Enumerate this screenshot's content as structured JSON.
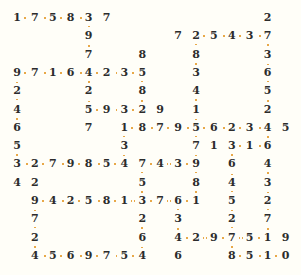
{
  "puzzle": {
    "type": "number-chain-grid",
    "cols": 16,
    "rows": 14,
    "origin": {
      "x": 17,
      "y": 18
    },
    "pitch": {
      "x": 17.9,
      "y": 18.3
    },
    "colors": {
      "digit": "#2c2c2c",
      "connector": "#e8a848",
      "background": "#fffef8"
    },
    "cells": [
      [
        0,
        0,
        "1"
      ],
      [
        0,
        1,
        "7"
      ],
      [
        0,
        2,
        "5"
      ],
      [
        0,
        3,
        "8"
      ],
      [
        0,
        4,
        "3"
      ],
      [
        0,
        5,
        "7"
      ],
      [
        0,
        14,
        "2"
      ],
      [
        1,
        4,
        "9"
      ],
      [
        1,
        9,
        "7"
      ],
      [
        1,
        10,
        "2"
      ],
      [
        1,
        11,
        "5"
      ],
      [
        1,
        12,
        "4"
      ],
      [
        1,
        13,
        "3"
      ],
      [
        1,
        14,
        "7"
      ],
      [
        2,
        4,
        "7"
      ],
      [
        2,
        7,
        "8"
      ],
      [
        2,
        10,
        "8"
      ],
      [
        2,
        14,
        "3"
      ],
      [
        3,
        0,
        "9"
      ],
      [
        3,
        1,
        "7"
      ],
      [
        3,
        2,
        "1"
      ],
      [
        3,
        3,
        "6"
      ],
      [
        3,
        4,
        "4"
      ],
      [
        3,
        5,
        "2"
      ],
      [
        3,
        6,
        "3"
      ],
      [
        3,
        7,
        "5"
      ],
      [
        3,
        10,
        "3"
      ],
      [
        3,
        14,
        "6"
      ],
      [
        4,
        0,
        "2"
      ],
      [
        4,
        4,
        "2"
      ],
      [
        4,
        7,
        "8"
      ],
      [
        4,
        10,
        "4"
      ],
      [
        4,
        14,
        "5"
      ],
      [
        5,
        0,
        "4"
      ],
      [
        5,
        4,
        "5"
      ],
      [
        5,
        5,
        "9"
      ],
      [
        5,
        6,
        "3"
      ],
      [
        5,
        7,
        "2"
      ],
      [
        5,
        8,
        "9"
      ],
      [
        5,
        10,
        "1"
      ],
      [
        5,
        14,
        "2"
      ],
      [
        6,
        0,
        "6"
      ],
      [
        6,
        4,
        "7"
      ],
      [
        6,
        6,
        "1"
      ],
      [
        6,
        7,
        "8"
      ],
      [
        6,
        8,
        "7"
      ],
      [
        6,
        9,
        "9"
      ],
      [
        6,
        10,
        "5"
      ],
      [
        6,
        11,
        "6"
      ],
      [
        6,
        12,
        "2"
      ],
      [
        6,
        13,
        "3"
      ],
      [
        6,
        14,
        "4"
      ],
      [
        6,
        15,
        "5"
      ],
      [
        7,
        0,
        "5"
      ],
      [
        7,
        6,
        "3"
      ],
      [
        7,
        10,
        "7"
      ],
      [
        7,
        11,
        "1"
      ],
      [
        7,
        12,
        "3"
      ],
      [
        7,
        13,
        "1"
      ],
      [
        7,
        14,
        "6"
      ],
      [
        8,
        0,
        "3"
      ],
      [
        8,
        1,
        "2"
      ],
      [
        8,
        2,
        "7"
      ],
      [
        8,
        3,
        "9"
      ],
      [
        8,
        4,
        "8"
      ],
      [
        8,
        5,
        "5"
      ],
      [
        8,
        6,
        "4"
      ],
      [
        8,
        7,
        "7"
      ],
      [
        8,
        8,
        "4"
      ],
      [
        8,
        9,
        "3"
      ],
      [
        8,
        10,
        "9"
      ],
      [
        8,
        12,
        "6"
      ],
      [
        8,
        14,
        "4"
      ],
      [
        9,
        0,
        "4"
      ],
      [
        9,
        1,
        "2"
      ],
      [
        9,
        7,
        "5"
      ],
      [
        9,
        10,
        "8"
      ],
      [
        9,
        12,
        "4"
      ],
      [
        9,
        14,
        "3"
      ],
      [
        10,
        1,
        "9"
      ],
      [
        10,
        2,
        "4"
      ],
      [
        10,
        3,
        "2"
      ],
      [
        10,
        4,
        "5"
      ],
      [
        10,
        5,
        "8"
      ],
      [
        10,
        6,
        "1"
      ],
      [
        10,
        7,
        "3"
      ],
      [
        10,
        8,
        "7"
      ],
      [
        10,
        9,
        "6"
      ],
      [
        10,
        10,
        "1"
      ],
      [
        10,
        12,
        "5"
      ],
      [
        10,
        14,
        "2"
      ],
      [
        11,
        1,
        "7"
      ],
      [
        11,
        7,
        "2"
      ],
      [
        11,
        9,
        "3"
      ],
      [
        11,
        12,
        "2"
      ],
      [
        11,
        14,
        "7"
      ],
      [
        12,
        1,
        "2"
      ],
      [
        12,
        7,
        "6"
      ],
      [
        12,
        9,
        "4"
      ],
      [
        12,
        10,
        "2"
      ],
      [
        12,
        11,
        "9"
      ],
      [
        12,
        12,
        "7"
      ],
      [
        12,
        13,
        "5"
      ],
      [
        12,
        14,
        "1"
      ],
      [
        12,
        15,
        "9"
      ],
      [
        13,
        1,
        "4"
      ],
      [
        13,
        2,
        "5"
      ],
      [
        13,
        3,
        "6"
      ],
      [
        13,
        4,
        "9"
      ],
      [
        13,
        5,
        "7"
      ],
      [
        13,
        6,
        "5"
      ],
      [
        13,
        7,
        "4"
      ],
      [
        13,
        9,
        "6"
      ],
      [
        13,
        12,
        "8"
      ],
      [
        13,
        13,
        "5"
      ],
      [
        13,
        14,
        "1"
      ],
      [
        13,
        15,
        "0"
      ]
    ],
    "h_links": [
      [
        0,
        0,
        4
      ],
      [
        1,
        10,
        14
      ],
      [
        3,
        0,
        7
      ],
      [
        5,
        4,
        7
      ],
      [
        6,
        6,
        14
      ],
      [
        7,
        12,
        14
      ],
      [
        8,
        0,
        6
      ],
      [
        8,
        7,
        10
      ],
      [
        10,
        1,
        10
      ],
      [
        12,
        9,
        14
      ],
      [
        13,
        1,
        7
      ],
      [
        13,
        12,
        15
      ]
    ],
    "v_links": [
      [
        0,
        3,
        8
      ],
      [
        4,
        0,
        5
      ],
      [
        7,
        3,
        5
      ],
      [
        10,
        1,
        10
      ],
      [
        14,
        1,
        12
      ],
      [
        6,
        6,
        8
      ],
      [
        7,
        8,
        13
      ],
      [
        1,
        10,
        13
      ],
      [
        9,
        10,
        12
      ],
      [
        12,
        7,
        13
      ]
    ]
  }
}
